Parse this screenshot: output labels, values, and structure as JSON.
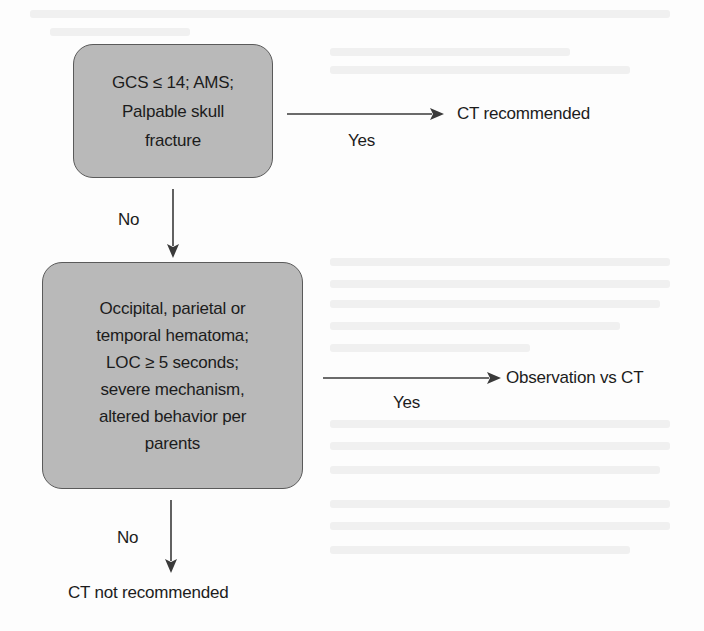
{
  "diagram": {
    "type": "flowchart",
    "nodes": [
      {
        "id": "decision-1",
        "lines": [
          "GCS ≤ 14; AMS;",
          "Palpable skull",
          "fracture"
        ]
      },
      {
        "id": "decision-2",
        "lines": [
          "Occipital, parietal or",
          "temporal hematoma;",
          "LOC ≥ 5 seconds;",
          "severe mechanism,",
          "altered behavior per",
          "parents"
        ]
      }
    ],
    "outcomes": {
      "ct_recommended": "CT recommended",
      "observation_vs_ct": "Observation vs CT",
      "ct_not_recommended": "CT not recommended"
    },
    "edge_labels": {
      "yes_1": "Yes",
      "no_1": "No",
      "yes_2": "Yes",
      "no_2": "No"
    },
    "edges": [
      {
        "from": "decision-1",
        "to": "ct_recommended",
        "label": "Yes"
      },
      {
        "from": "decision-1",
        "to": "decision-2",
        "label": "No"
      },
      {
        "from": "decision-2",
        "to": "observation_vs_ct",
        "label": "Yes"
      },
      {
        "from": "decision-2",
        "to": "ct_not_recommended",
        "label": "No"
      }
    ],
    "colors": {
      "box_fill": "#b9b9b9",
      "box_border": "#5a5a5a",
      "arrow": "#3a3a3a",
      "text": "#1c1c1c",
      "background": "#fdfdfd"
    }
  }
}
